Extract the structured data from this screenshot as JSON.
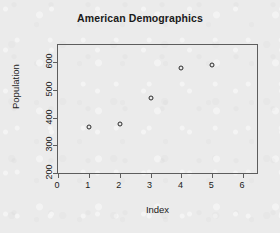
{
  "chart_data": {
    "type": "scatter",
    "title": "American Demographics",
    "xlabel": "Index",
    "ylabel": "Population",
    "x": [
      1,
      2,
      3,
      4,
      5
    ],
    "values": [
      368,
      379,
      470,
      578,
      590
    ],
    "xlim": [
      0,
      6.45
    ],
    "ylim": [
      200,
      663
    ],
    "xticks": [
      0,
      1,
      2,
      3,
      4,
      5,
      6
    ],
    "xtick_labels": [
      "0",
      "1",
      "2",
      "3",
      "4",
      "5",
      "6"
    ],
    "yticks": [
      200,
      300,
      400,
      500,
      600
    ],
    "ytick_labels": [
      "200",
      "300",
      "400",
      "500",
      "600"
    ],
    "grid": false,
    "legend": false,
    "marker": "open-circle",
    "marker_color": "#2b2b2b",
    "background_color": "#ebebeb",
    "axis_color": "#5d5d5d"
  }
}
